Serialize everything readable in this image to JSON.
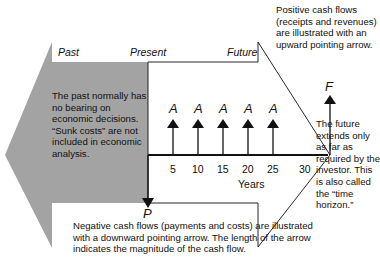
{
  "labels": {
    "past": "Past",
    "present": "Present",
    "future": "Future",
    "years": "Years",
    "present_value": "P",
    "future_value": "F",
    "annuity": "A"
  },
  "ticks": [
    "5",
    "10",
    "15",
    "20",
    "25",
    "30"
  ],
  "annotations": {
    "past_note": "The past normally has no bearing on economic decisions. “Sunk costs” are not included in economic analysis.",
    "positive_note": "Positive cash flows (receipts and revenues) are illustrated with an upward pointing arrow.",
    "future_note": "The future extends only as far as required by the investor. This is also called the “time horizon.”",
    "negative_note": "Negative cash flows (payments and costs) are illustrated with a downward pointing arrow. The length of the arrow indicates the magnitude of the cash flow."
  },
  "colors": {
    "past_fill": "#a3a3a3",
    "line": "#111111"
  }
}
